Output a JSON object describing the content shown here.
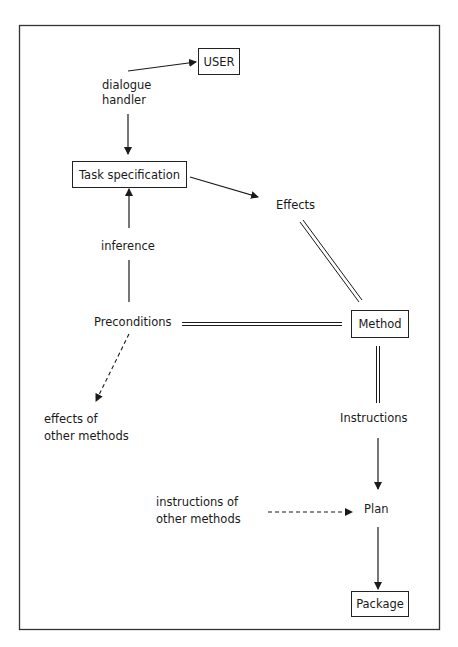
{
  "diagram": {
    "nodes": {
      "user": "USER",
      "dialogue_handler_line1": "dialogue",
      "dialogue_handler_line2": "handler",
      "task_specification": "Task specification",
      "effects": "Effects",
      "inference": "inference",
      "preconditions": "Preconditions",
      "method": "Method",
      "effects_other_line1": "effects of",
      "effects_other_line2": "other methods",
      "instructions": "Instructions",
      "instructions_other_line1": "instructions of",
      "instructions_other_line2": "other methods",
      "plan": "Plan",
      "package": "Package"
    },
    "edges": [
      {
        "from": "dialogue handler",
        "to": "USER",
        "style": "arrow"
      },
      {
        "from": "dialogue handler",
        "to": "Task specification",
        "style": "arrow"
      },
      {
        "from": "Task specification",
        "to": "Effects",
        "style": "arrow"
      },
      {
        "from": "Preconditions",
        "to": "Task specification",
        "style": "arrow",
        "label": "inference"
      },
      {
        "from": "Effects",
        "to": "Method",
        "style": "double-line"
      },
      {
        "from": "Preconditions",
        "to": "Method",
        "style": "double-line"
      },
      {
        "from": "Preconditions",
        "to": "effects of other methods",
        "style": "dashed-arrow"
      },
      {
        "from": "Method",
        "to": "Instructions",
        "style": "double-line"
      },
      {
        "from": "Instructions",
        "to": "Plan",
        "style": "arrow"
      },
      {
        "from": "instructions of other methods",
        "to": "Plan",
        "style": "dashed-arrow"
      },
      {
        "from": "Plan",
        "to": "Package",
        "style": "arrow"
      }
    ]
  }
}
